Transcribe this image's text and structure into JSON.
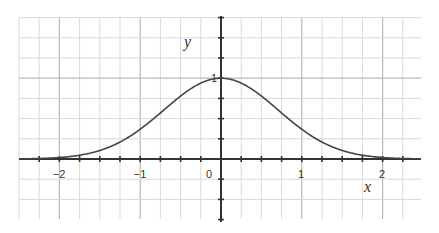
{
  "chart_data": {
    "type": "line",
    "title": "",
    "xlabel": "x",
    "ylabel": "y",
    "function": "y = exp(-x^2)",
    "xlim": [
      -2.5,
      2.5
    ],
    "ylim": [
      -0.8,
      1.75
    ],
    "grid": true,
    "minor_grid_step": 0.25,
    "major_grid_step": 1,
    "x_ticks": [
      -2,
      -1,
      0,
      1,
      2
    ],
    "x_tick_labels": [
      "-2",
      "-1",
      "0",
      "1",
      "2"
    ],
    "y_ticks": [
      1
    ],
    "y_tick_labels": [
      "1"
    ],
    "series": [
      {
        "name": "exp(-x^2)",
        "x": [
          -2.5,
          -2.0,
          -1.5,
          -1.0,
          -0.5,
          0.0,
          0.5,
          1.0,
          1.5,
          2.0,
          2.5
        ],
        "y": [
          0.002,
          0.018,
          0.105,
          0.368,
          0.779,
          1.0,
          0.779,
          0.368,
          0.105,
          0.018,
          0.002
        ]
      }
    ],
    "colors": {
      "curve": "#444444",
      "axis": "#333333",
      "grid_major": "#b8b8b8",
      "grid_minor": "#d9d9d9"
    }
  },
  "labels": {
    "x_axis": "x",
    "y_axis": "y",
    "x_ticks": [
      "-2",
      "-1",
      "0",
      "1",
      "2"
    ],
    "y_one": "1"
  }
}
